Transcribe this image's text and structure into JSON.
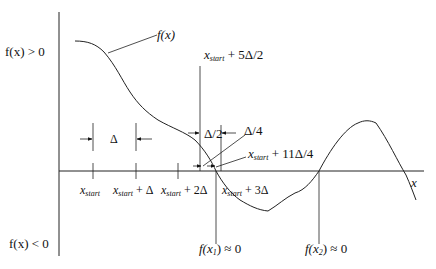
{
  "diagram": {
    "title": "",
    "function_label": "f(x)",
    "region_above": "f(x) > 0",
    "region_below": "f(x) < 0",
    "axis_label_x": "x",
    "step_label": "Δ",
    "half_step_label": "Δ/2",
    "quarter_step_label": "Δ/4",
    "ticks": [
      {
        "var": "x",
        "sub": "start",
        "suffix": ""
      },
      {
        "var": "x",
        "sub": "start",
        "suffix": " + Δ"
      },
      {
        "var": "x",
        "sub": "start",
        "suffix": " + 2Δ"
      },
      {
        "var": "x",
        "sub": "start",
        "suffix": " + 3Δ"
      }
    ],
    "annotations": {
      "five_half": {
        "var": "x",
        "sub": "start",
        "suffix": " + 5Δ/2"
      },
      "eleven_quarter": {
        "var": "x",
        "sub": "start",
        "suffix": " + 11Δ/4"
      }
    },
    "roots": [
      {
        "label_pre": "f(x",
        "sub": "1",
        "label_post": ") ≈ 0"
      },
      {
        "label_pre": "f(x",
        "sub": "2",
        "label_post": ") ≈ 0"
      }
    ],
    "colors": {
      "line": "#222222",
      "background": "#ffffff"
    }
  }
}
